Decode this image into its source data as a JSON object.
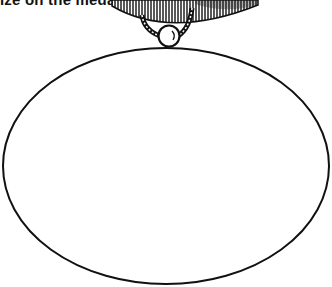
{
  "caption": "ize on the medal below:",
  "medal": {
    "shape": "ellipse",
    "stroke_color": "#111111",
    "fill_color": "#ffffff",
    "has_hanger": true,
    "hanger_icon": "ribbon-hanger-icon",
    "ring_icon": "ball-ring-icon"
  }
}
